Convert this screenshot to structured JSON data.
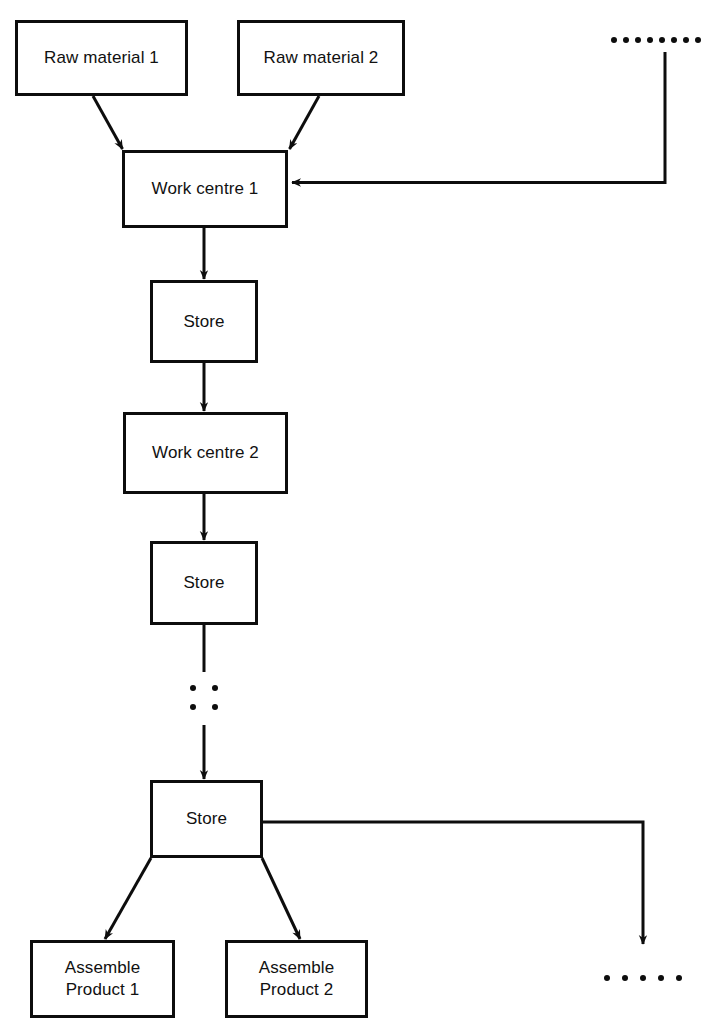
{
  "diagram": {
    "type": "process-flow-diagram",
    "stroke_color": "#0d0d0d",
    "background_color": "#ffffff",
    "nodes": [
      {
        "id": "raw-material-1",
        "label": "Raw material  1",
        "x": 15,
        "y": 20,
        "w": 173,
        "h": 76
      },
      {
        "id": "raw-material-2",
        "label": "Raw material 2",
        "x": 237,
        "y": 20,
        "w": 168,
        "h": 76
      },
      {
        "id": "work-centre-1",
        "label": "Work centre 1",
        "x": 122,
        "y": 150,
        "w": 166,
        "h": 78
      },
      {
        "id": "store-1",
        "label": "Store",
        "x": 150,
        "y": 280,
        "w": 108,
        "h": 83
      },
      {
        "id": "work-centre-2",
        "label": "Work centre 2",
        "x": 123,
        "y": 412,
        "w": 165,
        "h": 82
      },
      {
        "id": "store-2",
        "label": "Store",
        "x": 150,
        "y": 541,
        "w": 108,
        "h": 84
      },
      {
        "id": "store-3",
        "label": "Store",
        "x": 150,
        "y": 780,
        "w": 113,
        "h": 78
      },
      {
        "id": "assemble-product-1",
        "label": "Assemble\nProduct 1",
        "x": 30,
        "y": 940,
        "w": 145,
        "h": 78
      },
      {
        "id": "assemble-product-2",
        "label": "Assemble\nProduct 2",
        "x": 225,
        "y": 940,
        "w": 143,
        "h": 78
      }
    ],
    "edges": [
      {
        "id": "raw-material-1-to-work-centre-1",
        "from": "raw-material-1",
        "to": "work-centre-1",
        "arrow": true
      },
      {
        "id": "raw-material-2-to-work-centre-1",
        "from": "raw-material-2",
        "to": "work-centre-1",
        "arrow": true
      },
      {
        "id": "feedback-into-work-centre-1",
        "from": "continuation-top",
        "to": "work-centre-1",
        "arrow": true
      },
      {
        "id": "work-centre-1-to-store-1",
        "from": "work-centre-1",
        "to": "store-1",
        "arrow": true
      },
      {
        "id": "store-1-to-work-centre-2",
        "from": "store-1",
        "to": "work-centre-2",
        "arrow": true
      },
      {
        "id": "work-centre-2-to-store-2",
        "from": "work-centre-2",
        "to": "store-2",
        "arrow": true
      },
      {
        "id": "store-2-to-continuation",
        "from": "store-2",
        "to": "continuation-mid",
        "arrow": false
      },
      {
        "id": "continuation-to-store-3",
        "from": "continuation-mid",
        "to": "store-3",
        "arrow": true
      },
      {
        "id": "store-3-to-assemble-product-1",
        "from": "store-3",
        "to": "assemble-product-1",
        "arrow": true
      },
      {
        "id": "store-3-to-assemble-product-2",
        "from": "store-3",
        "to": "assemble-product-2",
        "arrow": true
      },
      {
        "id": "store-3-to-continuation-bottom",
        "from": "store-3",
        "to": "continuation-bottom",
        "arrow": true
      }
    ],
    "continuations": [
      {
        "id": "continuation-dots-top",
        "style": "horizontal-dots",
        "count": 8,
        "x": 611,
        "y": 37
      },
      {
        "id": "continuation-dots-mid",
        "style": "grid-dots",
        "count": 4,
        "x": 190,
        "y": 685
      },
      {
        "id": "continuation-dots-bottom-right",
        "style": "horizontal-dots",
        "count": 5,
        "x": 604,
        "y": 975
      }
    ]
  }
}
